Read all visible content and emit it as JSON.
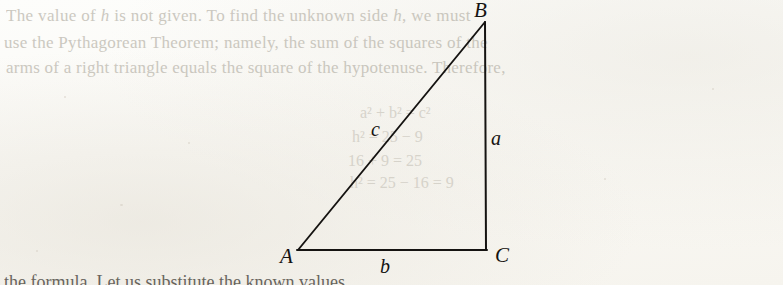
{
  "page": {
    "kind": "scanned-book-page",
    "paper_color": "#faf9f5",
    "ink_color": "#151311",
    "faded_ink_color": "#b9b5ab"
  },
  "body_text": {
    "line1_before": "The value of ",
    "line1_italic": "h",
    "line1_after": " is not given. To find the unknown side ",
    "line1_italic2": "h",
    "line1_tail": ", we must",
    "line2": "use the Pythagorean Theorem; namely, the sum of the squares of the",
    "line3": "arms of a right triangle equals the square of the hypotenuse. Therefore,"
  },
  "ghost_equations": [
    {
      "text": "a² + b² = c²",
      "x": 360,
      "y": 104
    },
    {
      "text": "h² = 25 − 9",
      "x": 352,
      "y": 128
    },
    {
      "text": "16 + 9 = 25",
      "x": 348,
      "y": 152
    },
    {
      "text": "h² = 25 − 16 = 9",
      "x": 350,
      "y": 174
    }
  ],
  "figure": {
    "name": "right-triangle-ABC",
    "vertices": {
      "A": {
        "x": 298,
        "y": 250
      },
      "B": {
        "x": 485,
        "y": 22
      },
      "C": {
        "x": 486,
        "y": 250
      }
    },
    "vertex_labels": {
      "A": "A",
      "B": "B",
      "C": "C"
    },
    "side_labels": {
      "hypotenuse": "c",
      "vertical_leg": "a",
      "base": "b"
    }
  },
  "bottom_clipped_text": "the formula. Let us substitute the known values"
}
